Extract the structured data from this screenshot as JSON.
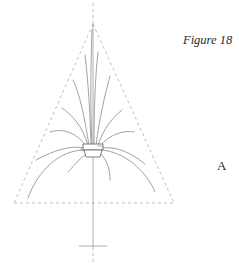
{
  "figure": {
    "caption": "Figure 18",
    "panel_label": "A",
    "colors": {
      "background": "#ffffff",
      "text": "#2a2a2a",
      "guide_lines": "#b8b8b8",
      "plant_lines": "#8a8a8a",
      "pot_outline": "#6f6f6f"
    }
  }
}
